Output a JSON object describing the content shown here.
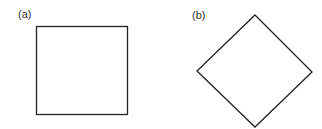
{
  "panels": [
    {
      "label": "(a)",
      "shape": "square"
    },
    {
      "label": "(b)",
      "shape": "diamond (square rotated 45°)"
    }
  ],
  "stroke_color": "#222222"
}
